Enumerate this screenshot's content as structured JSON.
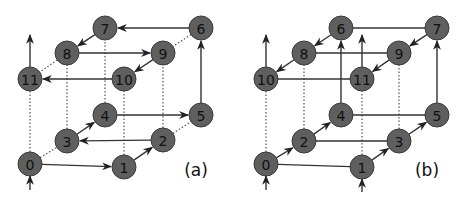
{
  "panels": [
    {
      "label": "(a)",
      "label_pos": [
        196,
        170
      ],
      "nodes": [
        {
          "id": "0",
          "x": 30,
          "y": 164
        },
        {
          "id": "1",
          "x": 124,
          "y": 167
        },
        {
          "id": "2",
          "x": 163,
          "y": 140
        },
        {
          "id": "3",
          "x": 67,
          "y": 141
        },
        {
          "id": "4",
          "x": 105,
          "y": 115
        },
        {
          "id": "5",
          "x": 201,
          "y": 115
        },
        {
          "id": "6",
          "x": 201,
          "y": 28
        },
        {
          "id": "7",
          "x": 105,
          "y": 28
        },
        {
          "id": "8",
          "x": 67,
          "y": 53
        },
        {
          "id": "9",
          "x": 163,
          "y": 53
        },
        {
          "id": "10",
          "x": 124,
          "y": 79
        },
        {
          "id": "11",
          "x": 30,
          "y": 79
        }
      ],
      "arrows": [
        [
          "0",
          "1"
        ],
        [
          "1",
          "2"
        ],
        [
          "2",
          "3"
        ],
        [
          "3",
          "4"
        ],
        [
          "4",
          "5"
        ],
        [
          "5",
          "6"
        ],
        [
          "6",
          "7"
        ],
        [
          "7",
          "8"
        ],
        [
          "8",
          "9"
        ],
        [
          "9",
          "10"
        ],
        [
          "10",
          "11"
        ]
      ],
      "dotted": [
        [
          "0",
          "3"
        ],
        [
          "2",
          "5"
        ],
        [
          "6",
          "9"
        ],
        [
          "8",
          "11"
        ],
        [
          "0",
          "11"
        ],
        [
          "3",
          "8"
        ],
        [
          "4",
          "7"
        ],
        [
          "1",
          "10"
        ],
        [
          "2",
          "9"
        ]
      ],
      "entry_arrows": [
        {
          "x": 30,
          "y1": 190,
          "y2": 176
        }
      ],
      "exit_arrows": [
        {
          "x": 30,
          "y1": 67,
          "y2": 35
        }
      ]
    },
    {
      "label": "(b)",
      "label_pos": [
        427,
        170
      ],
      "nodes": [
        {
          "id": "0",
          "x": 266,
          "y": 164
        },
        {
          "id": "1",
          "x": 362,
          "y": 167
        },
        {
          "id": "2",
          "x": 304,
          "y": 141
        },
        {
          "id": "3",
          "x": 399,
          "y": 141
        },
        {
          "id": "4",
          "x": 341,
          "y": 115
        },
        {
          "id": "5",
          "x": 437,
          "y": 115
        },
        {
          "id": "6",
          "x": 341,
          "y": 28
        },
        {
          "id": "7",
          "x": 437,
          "y": 28
        },
        {
          "id": "8",
          "x": 304,
          "y": 53
        },
        {
          "id": "9",
          "x": 399,
          "y": 53
        },
        {
          "id": "10",
          "x": 266,
          "y": 79
        },
        {
          "id": "11",
          "x": 362,
          "y": 79
        }
      ],
      "arrows": [
        [
          "0",
          "2"
        ],
        [
          "2",
          "4"
        ],
        [
          "1",
          "3"
        ],
        [
          "3",
          "5"
        ],
        [
          "4",
          "6"
        ],
        [
          "5",
          "7"
        ],
        [
          "6",
          "8"
        ],
        [
          "8",
          "10"
        ],
        [
          "7",
          "9"
        ],
        [
          "9",
          "11"
        ]
      ],
      "lines": [
        [
          "0",
          "1"
        ],
        [
          "2",
          "3"
        ],
        [
          "4",
          "5"
        ],
        [
          "6",
          "7"
        ],
        [
          "8",
          "9"
        ],
        [
          "10",
          "11"
        ]
      ],
      "dotted": [
        [
          "0",
          "10"
        ],
        [
          "2",
          "8"
        ],
        [
          "1",
          "11"
        ],
        [
          "3",
          "9"
        ]
      ],
      "entry_arrows": [
        {
          "x": 266,
          "y1": 190,
          "y2": 176
        },
        {
          "x": 362,
          "y1": 192,
          "y2": 179
        }
      ],
      "exit_arrows": [
        {
          "x": 266,
          "y1": 67,
          "y2": 35
        },
        {
          "x": 362,
          "y1": 67,
          "y2": 35
        }
      ]
    }
  ],
  "style": {
    "node_fill": "#5f5f5f",
    "node_stroke": "#3a3a3a",
    "edge_color": "#333333",
    "node_radius": 12
  }
}
